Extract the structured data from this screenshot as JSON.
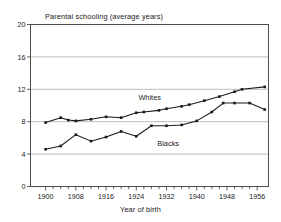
{
  "chart_data": {
    "type": "line",
    "title": "Parental schooling (average years)",
    "xlabel": "Year of birth",
    "ylabel": "",
    "xlim": [
      1896,
      1959
    ],
    "ylim": [
      0,
      20
    ],
    "grid": true,
    "legend_position": "inline-annotation",
    "x_ticks": [
      1900,
      1908,
      1916,
      1924,
      1932,
      1940,
      1948,
      1956
    ],
    "x_minor_tick_step": 2,
    "y_ticks": [
      0,
      4,
      8,
      12,
      16,
      20
    ],
    "x": [
      1900,
      1902,
      1904,
      1906,
      1908,
      1910,
      1912,
      1914,
      1916,
      1918,
      1920,
      1922,
      1924,
      1926,
      1928,
      1930,
      1932,
      1934,
      1936,
      1938,
      1940,
      1942,
      1944,
      1946,
      1948,
      1950,
      1952,
      1954,
      1956,
      1958
    ],
    "series": [
      {
        "name": "Whites",
        "color": "#1a1a1a",
        "marker": "square",
        "x": [
          1900,
          1904,
          1906,
          1908,
          1912,
          1916,
          1920,
          1924,
          1926,
          1930,
          1932,
          1936,
          1938,
          1942,
          1946,
          1950,
          1952,
          1958
        ],
        "values": [
          7.9,
          8.5,
          8.2,
          8.1,
          8.3,
          8.6,
          8.5,
          9.1,
          9.2,
          9.4,
          9.6,
          9.9,
          10.1,
          10.6,
          11.1,
          11.7,
          12.0,
          12.3
        ]
      },
      {
        "name": "Blacks",
        "color": "#1a1a1a",
        "marker": "square",
        "x": [
          1900,
          1904,
          1908,
          1912,
          1916,
          1920,
          1924,
          1928,
          1932,
          1936,
          1940,
          1944,
          1947,
          1950,
          1954,
          1958
        ],
        "values": [
          4.6,
          5.0,
          6.4,
          5.6,
          6.1,
          6.8,
          6.2,
          7.5,
          7.5,
          7.6,
          8.1,
          9.2,
          10.3,
          10.3,
          10.3,
          9.5
        ]
      }
    ],
    "annotations": [
      {
        "text": "Whites",
        "x": 1928,
        "y": 10.9
      },
      {
        "text": "Blacks",
        "x": 1933,
        "y": 5.2
      }
    ],
    "colors": {
      "line": "#1a1a1a",
      "grid": "#b4b4b4",
      "axis": "#4d4d4d",
      "background": "#ffffff",
      "text": "#1a1a1a"
    }
  }
}
